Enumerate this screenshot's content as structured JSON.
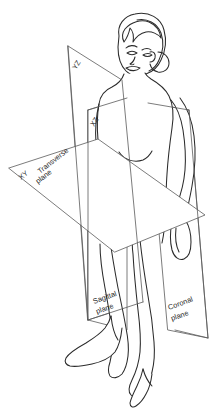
{
  "diagram": {
    "background_color": "#ffffff",
    "line_color": "#2b2b2b",
    "plane_line_color": "#5a5a5a",
    "canvas": {
      "width": 213,
      "height": 419
    }
  },
  "planes": [
    {
      "id": "sagittal",
      "name_label": "Sagittal",
      "name_label_line2": "plane",
      "axis_label": "YZ",
      "description": "Vertical plane dividing body into left and right"
    },
    {
      "id": "coronal",
      "name_label": "Coronal",
      "name_label_line2": "plane",
      "axis_label": "XZ",
      "description": "Vertical plane dividing body into front and back"
    },
    {
      "id": "transverse",
      "name_label": "Transverse",
      "name_label_line2": "plane",
      "axis_label": "XY",
      "description": "Horizontal plane dividing body into upper and lower"
    }
  ],
  "labels": {
    "yz": "YZ",
    "xz": "XZ",
    "xy": "XY",
    "transverse_1": "Transverse",
    "transverse_2": "plane",
    "sagittal_1": "Sagittal",
    "sagittal_2": "plane",
    "coronal_1": "Coronal",
    "coronal_2": "plane"
  }
}
